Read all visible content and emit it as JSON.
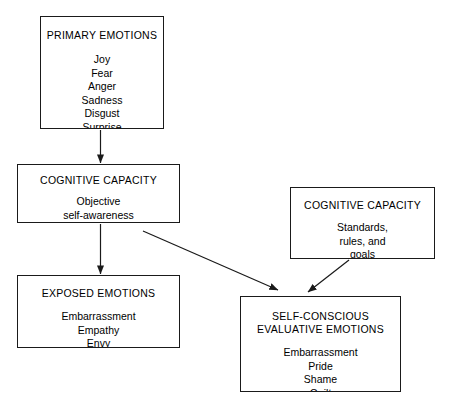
{
  "diagram": {
    "type": "flowchart",
    "title": "",
    "background_color": "#ffffff",
    "line_color": "#1a1a1a",
    "nodes": [
      {
        "id": "primary-emotions",
        "title": "PRIMARY EMOTIONS",
        "items": "Joy\nFear\nAnger\nSadness\nDisgust\nSurprise"
      },
      {
        "id": "cognitive-capacity-self",
        "title": "COGNITIVE CAPACITY",
        "items": "Objective\nself-awareness"
      },
      {
        "id": "exposed-emotions",
        "title": "EXPOSED EMOTIONS",
        "items": "Embarrassment\nEmpathy\nEnvy"
      },
      {
        "id": "cognitive-capacity-standards",
        "title": "COGNITIVE CAPACITY",
        "items": "Standards,\nrules, and\ngoals"
      },
      {
        "id": "self-conscious-emotions",
        "title": "SELF-CONSCIOUS\nEVALUATIVE EMOTIONS",
        "items": "Embarrassment\nPride\nShame\nGuilt"
      }
    ],
    "edges": [
      {
        "id": "primary-to-cognitive",
        "from": "primary-emotions",
        "to": "cognitive-capacity-self",
        "style": "solid-arrow"
      },
      {
        "id": "cognitive-to-exposed",
        "from": "cognitive-capacity-self",
        "to": "exposed-emotions",
        "style": "solid-arrow"
      },
      {
        "id": "cognitive-to-self-conscious",
        "from": "cognitive-capacity-self",
        "to": "self-conscious-emotions",
        "style": "solid-arrow"
      },
      {
        "id": "standards-to-self-conscious",
        "from": "cognitive-capacity-standards",
        "to": "self-conscious-emotions",
        "style": "solid-arrow"
      }
    ]
  }
}
